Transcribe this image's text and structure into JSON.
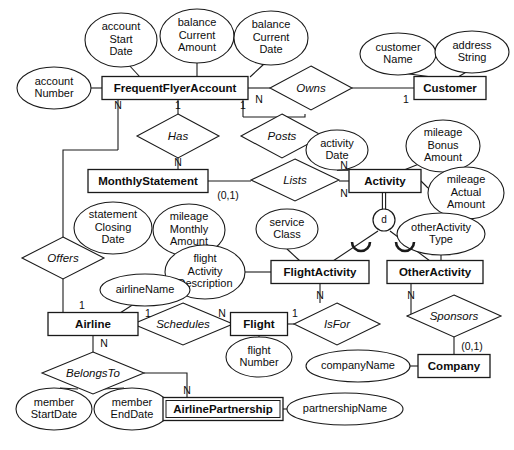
{
  "diagram": {
    "notation": "Chen ER with specialization",
    "background_color": "#ffffff",
    "line_color": "#1a1a1a"
  },
  "entities": [
    {
      "id": "frequentflyeraccount",
      "label": "FrequentFlyerAccount",
      "x": 175,
      "y": 88,
      "w": 146,
      "h": 23,
      "weak": false
    },
    {
      "id": "customer",
      "label": "Customer",
      "x": 450,
      "y": 88,
      "w": 72,
      "h": 23,
      "weak": false
    },
    {
      "id": "monthlystatement",
      "label": "MonthlyStatement",
      "x": 148,
      "y": 181,
      "w": 120,
      "h": 23,
      "weak": false
    },
    {
      "id": "activity",
      "label": "Activity",
      "x": 385,
      "y": 181,
      "w": 72,
      "h": 23,
      "weak": false
    },
    {
      "id": "flightactivity",
      "label": "FlightActivity",
      "x": 320,
      "y": 272,
      "w": 98,
      "h": 23,
      "weak": false
    },
    {
      "id": "otheractivity",
      "label": "OtherActivity",
      "x": 435,
      "y": 272,
      "w": 96,
      "h": 23,
      "weak": false
    },
    {
      "id": "airline",
      "label": "Airline",
      "x": 93,
      "y": 324,
      "w": 90,
      "h": 23,
      "weak": false
    },
    {
      "id": "flight",
      "label": "Flight",
      "x": 259,
      "y": 324,
      "w": 57,
      "h": 23,
      "weak": false
    },
    {
      "id": "company",
      "label": "Company",
      "x": 454,
      "y": 366,
      "w": 72,
      "h": 23,
      "weak": false
    },
    {
      "id": "airlinepartnership",
      "label": "AirlinePartnership",
      "x": 223,
      "y": 409,
      "w": 120,
      "h": 23,
      "weak": true
    }
  ],
  "attributes": [
    {
      "id": "accountstartdate",
      "label": [
        "account",
        "Start",
        "Date"
      ],
      "cx": 121,
      "cy": 40,
      "rx": 36,
      "ry": 27
    },
    {
      "id": "balancecurrentamount",
      "label": [
        "balance",
        "Current",
        "Amount"
      ],
      "cx": 197,
      "cy": 36,
      "rx": 37,
      "ry": 27
    },
    {
      "id": "balancecurrentdate",
      "label": [
        "balance",
        "Current",
        "Date"
      ],
      "cx": 271,
      "cy": 38,
      "rx": 37,
      "ry": 27
    },
    {
      "id": "accountnumber",
      "label": [
        "account",
        "Number"
      ],
      "cx": 54,
      "cy": 88,
      "rx": 37,
      "ry": 21
    },
    {
      "id": "customername",
      "label": [
        "customer",
        "Name"
      ],
      "cx": 398,
      "cy": 54,
      "rx": 38,
      "ry": 21
    },
    {
      "id": "addressstring",
      "label": [
        "address",
        "String"
      ],
      "cx": 472,
      "cy": 52,
      "rx": 37,
      "ry": 21
    },
    {
      "id": "statementclosingdate",
      "label": [
        "statement",
        "Closing",
        "Date"
      ],
      "cx": 113,
      "cy": 228,
      "rx": 39,
      "ry": 26
    },
    {
      "id": "mileagemonthlyamount",
      "label": [
        "mileage",
        "Monthly",
        "Amount"
      ],
      "cx": 189,
      "cy": 230,
      "rx": 36,
      "ry": 26
    },
    {
      "id": "activitydate",
      "label": [
        "activity",
        "Date"
      ],
      "cx": 337,
      "cy": 150,
      "rx": 31,
      "ry": 20
    },
    {
      "id": "mileagebonusamount",
      "label": [
        "mileage",
        "Bonus",
        "Amount"
      ],
      "cx": 443,
      "cy": 146,
      "rx": 37,
      "ry": 26
    },
    {
      "id": "mileageactualamount",
      "label": [
        "mileage",
        "Actual",
        "Amount"
      ],
      "cx": 466,
      "cy": 193,
      "rx": 38,
      "ry": 26
    },
    {
      "id": "serviceclass",
      "label": [
        "service",
        "Class"
      ],
      "cx": 287,
      "cy": 229,
      "rx": 31,
      "ry": 20
    },
    {
      "id": "flightactivitydescription",
      "label": [
        "flight",
        "Activity",
        "Description"
      ],
      "cx": 205,
      "cy": 272,
      "rx": 40,
      "ry": 27
    },
    {
      "id": "otheractivitytype",
      "label": [
        "otherActivity",
        "Type"
      ],
      "cx": 441,
      "cy": 234,
      "rx": 44,
      "ry": 21
    },
    {
      "id": "airlinename",
      "label": [
        "airlineName"
      ],
      "cx": 145,
      "cy": 290,
      "rx": 45,
      "ry": 16
    },
    {
      "id": "flightnumber",
      "label": [
        "flight",
        "Number"
      ],
      "cx": 259,
      "cy": 357,
      "rx": 33,
      "ry": 20
    },
    {
      "id": "companyname",
      "label": [
        "companyName"
      ],
      "cx": 358,
      "cy": 366,
      "rx": 52,
      "ry": 16
    },
    {
      "id": "partnershipname",
      "label": [
        "partnershipName"
      ],
      "cx": 345,
      "cy": 409,
      "rx": 58,
      "ry": 16
    },
    {
      "id": "memberstartdate",
      "label": [
        "member",
        "StartDate"
      ],
      "cx": 54,
      "cy": 409,
      "rx": 38,
      "ry": 21
    },
    {
      "id": "memberenddate",
      "label": [
        "member",
        "EndDate"
      ],
      "cx": 132,
      "cy": 409,
      "rx": 38,
      "ry": 21
    }
  ],
  "relationships": [
    {
      "id": "owns",
      "label": "Owns",
      "cx": 311,
      "cy": 88,
      "rx": 41,
      "ry": 22
    },
    {
      "id": "has",
      "label": "Has",
      "cx": 178,
      "cy": 136,
      "rx": 41,
      "ry": 22
    },
    {
      "id": "posts",
      "label": "Posts",
      "cx": 282,
      "cy": 136,
      "rx": 41,
      "ry": 22
    },
    {
      "id": "lists",
      "label": "Lists",
      "cx": 295,
      "cy": 180,
      "rx": 44,
      "ry": 21
    },
    {
      "id": "offers",
      "label": "Offers",
      "cx": 63,
      "cy": 258,
      "rx": 41,
      "ry": 21
    },
    {
      "id": "schedules",
      "label": "Schedules",
      "cx": 183,
      "cy": 324,
      "rx": 50,
      "ry": 21
    },
    {
      "id": "isfor",
      "label": "IsFor",
      "cx": 337,
      "cy": 324,
      "rx": 43,
      "ry": 21
    },
    {
      "id": "sponsors",
      "label": "Sponsors",
      "cx": 454,
      "cy": 316,
      "rx": 47,
      "ry": 21
    },
    {
      "id": "belongsto",
      "label": "BelongsTo",
      "cx": 93,
      "cy": 373,
      "rx": 51,
      "ry": 21
    }
  ],
  "specialization": {
    "id": "activity-disjoint",
    "symbol": "d",
    "label": "d",
    "cx": 384,
    "cy": 220,
    "r": 11,
    "kind": "disjoint",
    "parent": "activity",
    "children": [
      "flightactivity",
      "otheractivity"
    ]
  },
  "cardinalities": [
    {
      "id": "ffa-has-1",
      "label": "1",
      "x": 178,
      "y": 106
    },
    {
      "id": "ffa-offers-N",
      "label": "N",
      "x": 118,
      "y": 106
    },
    {
      "id": "ffa-posts-1",
      "label": "1",
      "x": 243,
      "y": 106
    },
    {
      "id": "ffa-owns-N",
      "label": "N",
      "x": 259,
      "y": 100
    },
    {
      "id": "owns-cust-1",
      "label": "1",
      "x": 406,
      "y": 100
    },
    {
      "id": "has-ms-N",
      "label": "N",
      "x": 178,
      "y": 163
    },
    {
      "id": "ms-lists-01",
      "label": "(0,1)",
      "x": 228,
      "y": 196
    },
    {
      "id": "lists-act-N",
      "label": "N",
      "x": 344,
      "y": 194
    },
    {
      "id": "posts-act-N",
      "label": "N",
      "x": 344,
      "y": 166
    },
    {
      "id": "fa-isfor-N",
      "label": "N",
      "x": 320,
      "y": 296
    },
    {
      "id": "flight-isfor-1",
      "label": "1",
      "x": 295,
      "y": 314
    },
    {
      "id": "oa-sponsors-N",
      "label": "N",
      "x": 411,
      "y": 296
    },
    {
      "id": "company-01",
      "label": "(0,1)",
      "x": 472,
      "y": 347
    },
    {
      "id": "airline-offers-1",
      "label": "1",
      "x": 82,
      "y": 306
    },
    {
      "id": "airline-sched-1",
      "label": "1",
      "x": 148,
      "y": 314
    },
    {
      "id": "flight-sched-N",
      "label": "N",
      "x": 222,
      "y": 314
    },
    {
      "id": "airline-belongs-N",
      "label": "N",
      "x": 104,
      "y": 344
    },
    {
      "id": "ap-belongs-N",
      "label": "N",
      "x": 187,
      "y": 391
    }
  ]
}
